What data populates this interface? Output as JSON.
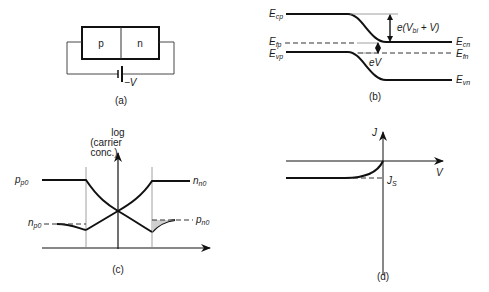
{
  "figure": {
    "panels": [
      {
        "id": "a",
        "caption": "(a)"
      },
      {
        "id": "b",
        "caption": "(b)"
      },
      {
        "id": "c",
        "caption": "(c)"
      },
      {
        "id": "d",
        "caption": "(d)"
      }
    ]
  },
  "panel_a": {
    "p_label": "p",
    "n_label": "n",
    "bias_label": "−V",
    "caption": "(a)"
  },
  "panel_b": {
    "left_labels": {
      "cp": "E",
      "cp_sub": "cp",
      "fp": "E",
      "fp_sub": "fp",
      "vp": "E",
      "vp_sub": "vp"
    },
    "right_labels": {
      "cn": "E",
      "cn_sub": "cn",
      "fn": "E",
      "fn_sub": "fn",
      "vn": "E",
      "vn_sub": "vn"
    },
    "barrier_label": "e(V",
    "barrier_sub": "bi",
    "barrier_tail": " + V)",
    "split_label": "eV",
    "caption": "(b)"
  },
  "panel_c": {
    "y_axis_label_1": "log",
    "y_axis_label_2": "(carrier",
    "y_axis_label_3": "conc.)",
    "pp0": "p",
    "pp0_sub": "p0",
    "nn0": "n",
    "nn0_sub": "n0",
    "np0": "n",
    "np0_sub": "p0",
    "pn0": "p",
    "pn0_sub": "n0",
    "caption": "(c)"
  },
  "panel_d": {
    "y_axis_label": "J",
    "x_axis_label": "V",
    "saturation_label": "J",
    "saturation_sub": "S",
    "caption": "(d)"
  }
}
